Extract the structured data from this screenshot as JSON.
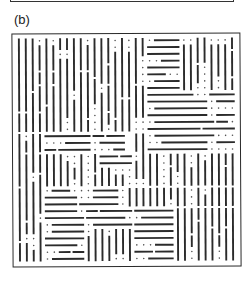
{
  "figure": {
    "panel_label": "(b)",
    "colors": {
      "line": "#2b2b2b",
      "dot": "#555555",
      "border": "#2a2a2a",
      "background": "#ffffff"
    },
    "grid": {
      "cols": 32,
      "rows": 33
    },
    "regions": [
      {
        "c0": 0,
        "r0": 0,
        "c1": 17,
        "r1": 14,
        "o": "v"
      },
      {
        "c0": 17,
        "r0": 0,
        "c1": 19,
        "r1": 12,
        "o": "v"
      },
      {
        "c0": 19,
        "r0": 0,
        "c1": 24,
        "r1": 8,
        "o": "h"
      },
      {
        "c0": 24,
        "r0": 0,
        "c1": 32,
        "r1": 8,
        "o": "v"
      },
      {
        "c0": 19,
        "r0": 8,
        "c1": 32,
        "r1": 13,
        "o": "h"
      },
      {
        "c0": 4,
        "r0": 14,
        "c1": 16,
        "r1": 17,
        "o": "h"
      },
      {
        "c0": 0,
        "r0": 14,
        "c1": 4,
        "r1": 33,
        "o": "v"
      },
      {
        "c0": 4,
        "r0": 17,
        "c1": 12,
        "r1": 22,
        "o": "v"
      },
      {
        "c0": 12,
        "r0": 17,
        "c1": 17,
        "r1": 19,
        "o": "h"
      },
      {
        "c0": 17,
        "r0": 12,
        "c1": 19,
        "r1": 22,
        "o": "v"
      },
      {
        "c0": 19,
        "r0": 13,
        "c1": 32,
        "r1": 17,
        "o": "h"
      },
      {
        "c0": 12,
        "r0": 19,
        "c1": 17,
        "r1": 22,
        "o": "v"
      },
      {
        "c0": 19,
        "r0": 17,
        "c1": 24,
        "r1": 22,
        "o": "v"
      },
      {
        "c0": 24,
        "r0": 17,
        "c1": 32,
        "r1": 22,
        "o": "v"
      },
      {
        "c0": 4,
        "r0": 22,
        "c1": 15,
        "r1": 25,
        "o": "h"
      },
      {
        "c0": 15,
        "r0": 22,
        "c1": 32,
        "r1": 25,
        "o": "v"
      },
      {
        "c0": 4,
        "r0": 25,
        "c1": 10,
        "r1": 33,
        "o": "h"
      },
      {
        "c0": 10,
        "r0": 25,
        "c1": 17,
        "r1": 28,
        "o": "h"
      },
      {
        "c0": 10,
        "r0": 28,
        "c1": 17,
        "r1": 33,
        "o": "v"
      },
      {
        "c0": 17,
        "r0": 25,
        "c1": 23,
        "r1": 33,
        "o": "h"
      },
      {
        "c0": 23,
        "r0": 25,
        "c1": 32,
        "r1": 33,
        "o": "v"
      }
    ],
    "seed": 20240601
  }
}
